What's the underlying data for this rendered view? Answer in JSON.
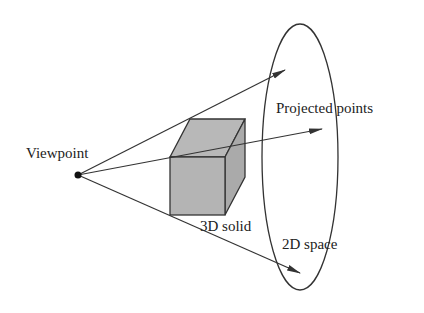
{
  "diagram": {
    "labels": {
      "viewpoint": "Viewpoint",
      "projected_points": "Projected points",
      "solid": "3D solid",
      "space": "2D space"
    },
    "colors": {
      "line": "#333333",
      "cube_fill": "#b4b4b4",
      "background": "#ffffff"
    }
  }
}
